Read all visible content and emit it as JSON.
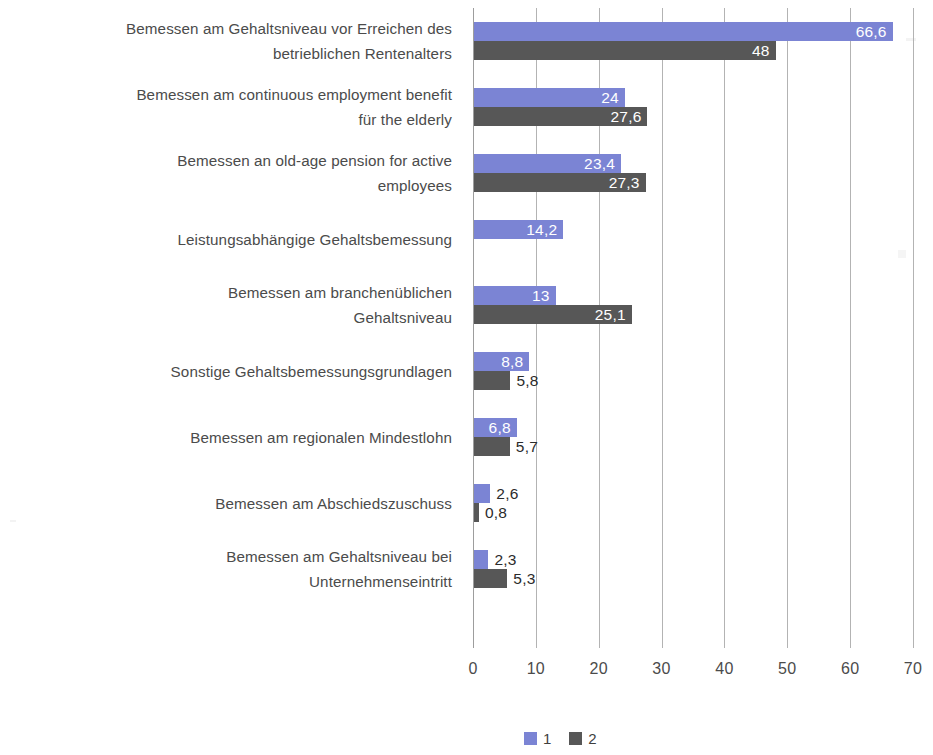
{
  "chart_data": {
    "type": "bar",
    "orientation": "horizontal",
    "title": "",
    "xlabel": "",
    "ylabel": "",
    "xlim": [
      0,
      70
    ],
    "xticks": [
      "0",
      "10",
      "20",
      "30",
      "40",
      "50",
      "60",
      "70"
    ],
    "grid": true,
    "legend_position": "bottom",
    "series": [
      {
        "name": "1",
        "color": "#7b84d4",
        "values": [
          66.6,
          24,
          23.4,
          14.2,
          13,
          8.8,
          6.8,
          2.6,
          2.3
        ],
        "labels": [
          "66,6",
          "24",
          "23,4",
          "14,2",
          "13",
          "8,8",
          "6,8",
          "2,6",
          "2,3"
        ]
      },
      {
        "name": "2",
        "color": "#575757",
        "values": [
          48,
          27.6,
          27.3,
          null,
          25.1,
          5.8,
          5.7,
          0.8,
          5.3
        ],
        "labels": [
          "48",
          "27,6",
          "27,3",
          "",
          "25,1",
          "5,8",
          "5,7",
          "0,8",
          "5,3"
        ]
      }
    ],
    "categories": [
      "Bemessen am Gehaltsniveau vor Erreichen des betrieblichen Rentenalters",
      "Bemessen am continuous employment benefit for the elderly",
      "Bemessen an old-age pension for active employees",
      "Leistungsabhängige Gehaltsbemessung",
      "Bemessen am branchenüblichen Gehaltsniveau",
      "Sonstige Gehaltsbemessungsgrundlagen",
      "Bemessen am regionalen Mindestlohn",
      "Bemessen am Abschiedszuschuss",
      "Bemessen am Gehaltsniveau bei Unternehmenseintritt"
    ]
  },
  "categories_display": [
    "Bemessen am Gehaltsniveau vor Erreichen des\nbetrieblichen Rentenalters",
    "Bemessen am continuous employment benefit\nfür the elderly",
    "Bemessen an old-age pension for active\nemployees",
    "Leistungsabhängige Gehaltsbemessung",
    "Bemessen am branchenüblichen\nGehaltsniveau",
    "Sonstige Gehaltsbemessungsgrundlagen",
    "Bemessen am regionalen Mindestlohn",
    "Bemessen am Abschiedszuschuss",
    "Bemessen am Gehaltsniveau bei\nUnternehmenseintritt"
  ],
  "legend": {
    "items": [
      {
        "label": "1",
        "color": "#7b84d4"
      },
      {
        "label": "2",
        "color": "#575757"
      }
    ]
  }
}
